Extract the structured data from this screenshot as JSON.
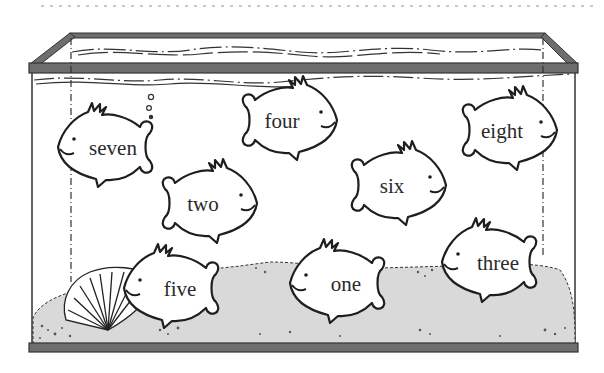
{
  "header": {
    "decoration": "dotted-rule"
  },
  "tank": {
    "frame_color": "#6e6e6e",
    "frame_outline": "#333333",
    "sand_color": "#d9d9d9",
    "water_color": "#ffffff"
  },
  "fish": [
    {
      "id": "seven",
      "label": "seven",
      "cx": 110,
      "cy": 147,
      "facing": "left"
    },
    {
      "id": "four",
      "label": "four",
      "cx": 285,
      "cy": 120,
      "facing": "right"
    },
    {
      "id": "eight",
      "label": "eight",
      "cx": 508,
      "cy": 130,
      "facing": "right"
    },
    {
      "id": "two",
      "label": "two",
      "cx": 207,
      "cy": 203,
      "facing": "right"
    },
    {
      "id": "six",
      "label": "six",
      "cx": 393,
      "cy": 185,
      "facing": "right"
    },
    {
      "id": "five",
      "label": "five",
      "cx": 178,
      "cy": 288,
      "facing": "left"
    },
    {
      "id": "one",
      "label": "one",
      "cx": 344,
      "cy": 283,
      "facing": "left"
    },
    {
      "id": "three",
      "label": "three",
      "cx": 496,
      "cy": 262,
      "facing": "left"
    }
  ],
  "decorations": {
    "bubbles": "bubbles-icon",
    "shell": "scallop-shell-icon",
    "sand": "sand-icon"
  }
}
